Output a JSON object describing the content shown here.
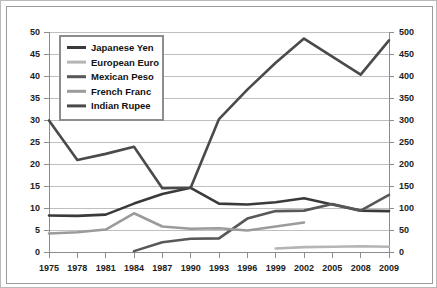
{
  "chart_data": {
    "type": "line",
    "title": "",
    "subtitle": "",
    "xlabel": "",
    "ylabel": "",
    "y2label": "",
    "grid": true,
    "legend_position": "top-left",
    "categories": [
      "1975",
      "1978",
      "1981",
      "1984",
      "1987",
      "1990",
      "1993",
      "1996",
      "1999",
      "2002",
      "2005",
      "2008",
      "2009"
    ],
    "ylim": [
      0,
      50
    ],
    "yticks": [
      "0",
      "5",
      "10",
      "15",
      "20",
      "25",
      "30",
      "35",
      "40",
      "45",
      "50"
    ],
    "y2lim": [
      0,
      500
    ],
    "y2ticks": [
      "0",
      "50",
      "100",
      "150",
      "200",
      "250",
      "300",
      "350",
      "400",
      "450",
      "500"
    ],
    "series": [
      {
        "name": "Japanese Yen",
        "color": "#3a3a3a",
        "axis": "left",
        "values": [
          8.3,
          8.2,
          8.5,
          11.0,
          13.2,
          14.6,
          11.0,
          10.8,
          11.3,
          12.2,
          10.8,
          9.4,
          9.3
        ]
      },
      {
        "name": "European Euro",
        "color": "#b5b5b5",
        "axis": "left",
        "values": [
          null,
          null,
          null,
          null,
          null,
          null,
          null,
          null,
          0.8,
          1.1,
          1.2,
          1.3,
          1.2
        ]
      },
      {
        "name": "Mexican Peso",
        "color": "#585858",
        "axis": "left",
        "values": [
          null,
          null,
          null,
          0.2,
          2.2,
          3.0,
          3.1,
          7.6,
          9.3,
          9.4,
          10.9,
          9.4,
          13.0
        ]
      },
      {
        "name": "French Franc",
        "color": "#9b9b9b",
        "axis": "left",
        "values": [
          4.2,
          4.5,
          5.1,
          8.8,
          5.8,
          5.3,
          5.4,
          4.9,
          5.8,
          6.7,
          null,
          null,
          null
        ]
      },
      {
        "name": "Indian Rupee",
        "color": "#4a4a4a",
        "axis": "left",
        "values": [
          29.9,
          20.9,
          22.3,
          23.9,
          14.5,
          14.6,
          30.2,
          36.9,
          43.0,
          48.5,
          44.4,
          40.3,
          48.1
        ]
      }
    ]
  },
  "legend": {
    "items": [
      {
        "label": "Japanese Yen"
      },
      {
        "label": "European Euro"
      },
      {
        "label": "Mexican Peso"
      },
      {
        "label": "French Franc"
      },
      {
        "label": "Indian Rupee"
      }
    ]
  },
  "colors": {
    "background": "#ffffff",
    "outer_border": "#b9b9b9",
    "inner_border": "#9a9a9a",
    "gridline": "#bfbfbf",
    "axis": "#8d8d8d",
    "text": "#1c1c1c"
  }
}
